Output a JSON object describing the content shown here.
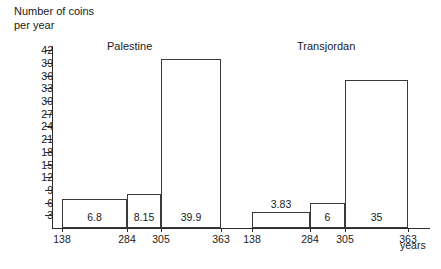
{
  "chart_data": {
    "type": "bar",
    "title": "",
    "ylabel": "Number of coins per year",
    "ylabel_line1": "Number of coins",
    "ylabel_line2": "per year",
    "xlabel": "years",
    "ylim": [
      0,
      43
    ],
    "yticks": [
      3,
      6,
      9,
      12,
      15,
      18,
      21,
      24,
      27,
      30,
      33,
      36,
      39,
      42
    ],
    "grid": false,
    "legend": "none",
    "categories": [
      "138",
      "284",
      "305",
      "363"
    ],
    "bin_edges": [
      "138",
      "284",
      "305",
      "363"
    ],
    "groups": [
      {
        "name": "Palestine",
        "bars": [
          {
            "label": "6.8",
            "value": 6.8,
            "from": "138",
            "to": "284"
          },
          {
            "label": "8.15",
            "value": 8.15,
            "from": "284",
            "to": "305"
          },
          {
            "label": "39.9",
            "value": 39.9,
            "from": "305",
            "to": "363"
          }
        ]
      },
      {
        "name": "Transjordan",
        "bars": [
          {
            "label": "3.83",
            "value": 3.83,
            "from": "138",
            "to": "284"
          },
          {
            "label": "6",
            "value": 6,
            "from": "284",
            "to": "305"
          },
          {
            "label": "35",
            "value": 35,
            "from": "305",
            "to": "363"
          }
        ]
      }
    ]
  }
}
